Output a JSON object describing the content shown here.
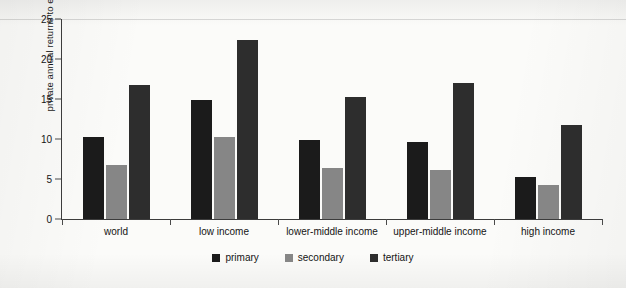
{
  "chart_data": {
    "type": "bar",
    "title": "",
    "xlabel": "",
    "ylabel": "private annual returns to education, %",
    "ylim": [
      0,
      25
    ],
    "yticks": [
      0,
      5,
      10,
      15,
      20,
      25
    ],
    "ytick_labels": [
      "0",
      "5",
      "10",
      "15",
      "20",
      "25"
    ],
    "grid": false,
    "legend_position": "bottom-center",
    "categories": [
      "world",
      "low income",
      "lower-middle income",
      "upper-middle income",
      "high income"
    ],
    "series": [
      {
        "name": "primary",
        "color": "#1b1b1b",
        "values": [
          10.3,
          14.9,
          9.9,
          9.6,
          5.2
        ]
      },
      {
        "name": "secondary",
        "color": "#868686",
        "values": [
          6.8,
          10.2,
          6.4,
          6.1,
          4.2
        ]
      },
      {
        "name": "tertiary",
        "color": "#2d2d2d",
        "values": [
          16.8,
          22.4,
          15.2,
          17.0,
          11.8
        ]
      }
    ]
  }
}
